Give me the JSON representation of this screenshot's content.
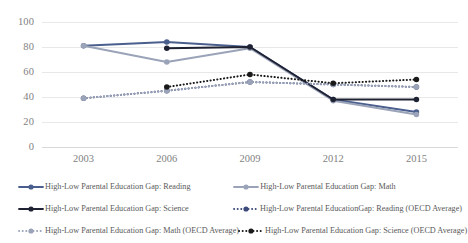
{
  "chart_data": {
    "type": "line",
    "title": "",
    "xlabel": "",
    "ylabel": "",
    "categories": [
      "2003",
      "2006",
      "2009",
      "2012",
      "2015"
    ],
    "ylim": [
      0,
      100
    ],
    "ytick_labels": [
      "0",
      "20",
      "40",
      "60",
      "80",
      "100"
    ],
    "ytick_values": [
      0,
      20,
      40,
      60,
      80,
      100
    ],
    "grid": true,
    "legend_position": "bottom",
    "series": [
      {
        "name": "High-Low Parental Education Gap: Reading",
        "color": "#4a5f8e",
        "style": "solid",
        "values": [
          81,
          84,
          80,
          38,
          28
        ]
      },
      {
        "name": "High-Low Parental Education Gap: Math",
        "color": "#9aa3b8",
        "style": "solid",
        "values": [
          81,
          68,
          79,
          37,
          26
        ]
      },
      {
        "name": "High-Low Parental Education Gap: Science",
        "color": "#1f2233",
        "style": "solid",
        "values": [
          null,
          79,
          80,
          38,
          38
        ]
      },
      {
        "name": "High-Low Parental EducationGap: Reading (OECD Average)",
        "color": "#3d4a7a",
        "style": "dotted",
        "values": [
          39,
          45,
          52,
          50,
          48
        ]
      },
      {
        "name": "High-Low Parental Education Gap: Math (OECD Average)",
        "color": "#9aa3b8",
        "style": "dotted",
        "values": [
          39,
          45,
          52,
          50,
          48
        ]
      },
      {
        "name": "High-Low Parental Education Gap: Science (OECD Average)",
        "color": "#1a1a1a",
        "style": "dotted",
        "values": [
          null,
          48,
          58,
          51,
          54
        ]
      }
    ]
  },
  "legend": {
    "rows": [
      [
        {
          "label": "High-Low Parental Education Gap: Reading",
          "color": "#4a5f8e",
          "style": "solid"
        },
        {
          "label": "High-Low Parental Education Gap: Math",
          "color": "#9aa3b8",
          "style": "solid"
        }
      ],
      [
        {
          "label": "High-Low Parental Education Gap: Science",
          "color": "#1f2233",
          "style": "solid"
        },
        {
          "label": "High-Low Parental EducationGap: Reading (OECD Average)",
          "color": "#3d4a7a",
          "style": "dotted"
        }
      ],
      [
        {
          "label": "High-Low Parental Education Gap: Math (OECD Average)",
          "color": "#9aa3b8",
          "style": "dotted"
        },
        {
          "label": "High-Low Parental Education Gap: Science (OECD Average)",
          "color": "#1a1a1a",
          "style": "dotted"
        }
      ]
    ]
  },
  "axes": {
    "gridline_color": "#e8e8e8"
  }
}
